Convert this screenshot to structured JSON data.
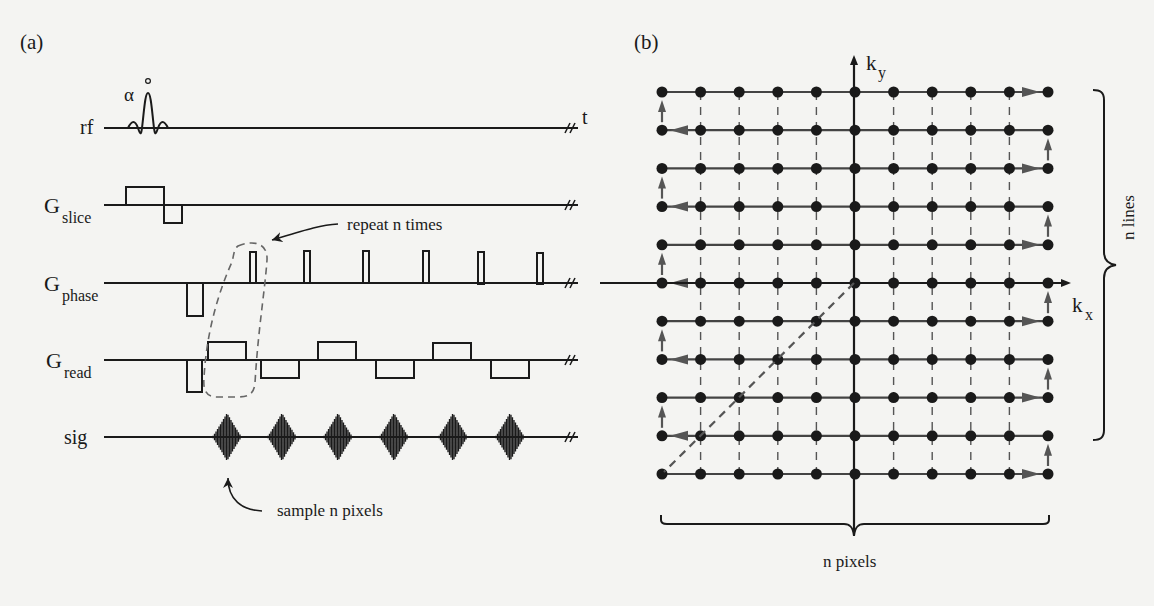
{
  "panels": {
    "a": {
      "label": "(a)",
      "title": "Pulse sequence timing diagram",
      "time_axis_label": "t",
      "flip_angle_label": "α",
      "flip_angle_degree": "°",
      "channels": [
        {
          "id": "rf",
          "label": "rf",
          "sub": ""
        },
        {
          "id": "gslice",
          "label": "G",
          "sub": "slice"
        },
        {
          "id": "gphase",
          "label": "G",
          "sub": "phase"
        },
        {
          "id": "gread",
          "label": "G",
          "sub": "read"
        },
        {
          "id": "sig",
          "label": "sig",
          "sub": ""
        }
      ],
      "repeat_annotation": "repeat n times",
      "sample_annotation": "sample n pixels",
      "num_echoes": 6
    },
    "b": {
      "label": "(b)",
      "title": "k-space trajectory",
      "ky_label": "k",
      "ky_sub": "y",
      "kx_label": "k",
      "kx_sub": "x",
      "n_lines_label": "n lines",
      "n_pixels_label": "n pixels",
      "grid_rows": 11,
      "grid_cols": 11
    }
  },
  "colors": {
    "ink": "#1a1a1a",
    "arrow_gray": "#555555",
    "dashed": "#666666",
    "background": "#f4f4f2"
  }
}
